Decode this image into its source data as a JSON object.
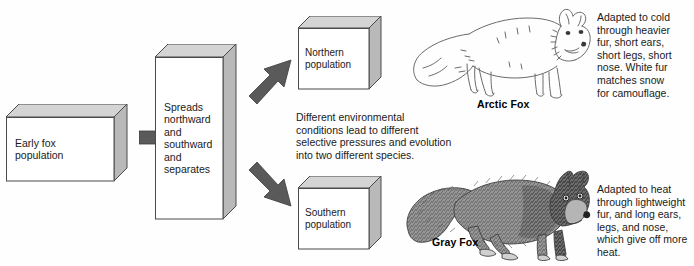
{
  "diagram": {
    "boxes": [
      {
        "id": "early-fox",
        "label": "Early fox\npopulation"
      },
      {
        "id": "spreads",
        "label": "Spreads\nnorthward\nand\nsouthward\nand\nseparates"
      },
      {
        "id": "northern",
        "label": "Northern\npopulation"
      },
      {
        "id": "southern",
        "label": "Southern\npopulation"
      }
    ],
    "arrows": [
      {
        "id": "arrow-right",
        "direction": "right"
      },
      {
        "id": "arrow-up-right",
        "direction": "up-right"
      },
      {
        "id": "arrow-down-right",
        "direction": "down-right"
      }
    ],
    "notes": {
      "middle": "Different environmental\nconditions lead to different\nselective pressures and evolution\ninto two different species.",
      "arctic": "Adapted to cold\nthrough heavier\nfur, short ears,\nshort legs, short\nnose. White fur\nmatches snow\nfor camouflage.",
      "gray": "Adapted to heat\nthrough lightweight\nfur, and long ears,\nlegs, and nose,\nwhich give off more\nheat."
    },
    "foxes": [
      {
        "id": "arctic-fox",
        "label": "Arctic Fox"
      },
      {
        "id": "gray-fox",
        "label": "Gray Fox"
      }
    ],
    "colors": {
      "arrow_fill": "#5a5a5a",
      "arrow_stroke": "#3c3c3c",
      "box_face": "#ffffff",
      "box_shade": "#b9b9b9",
      "box_top": "#d4d4d4",
      "box_outline": "#4a4a4a",
      "text": "#1a1a1a",
      "background": "#ffffff"
    }
  }
}
